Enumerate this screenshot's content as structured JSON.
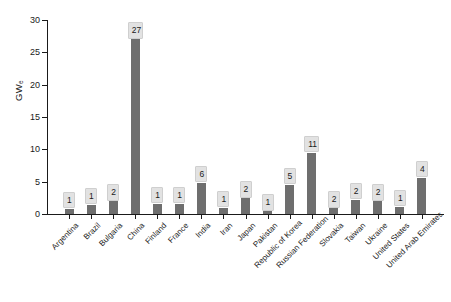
{
  "chart_data": {
    "type": "bar",
    "title": "",
    "xlabel": "",
    "ylabel": "GW",
    "ylabel_sub": "e",
    "ylim": [
      0,
      30
    ],
    "yticks": [
      0,
      5,
      10,
      15,
      20,
      25,
      30
    ],
    "ytick_labels": [
      "0",
      "5",
      "10",
      "15",
      "20",
      "25",
      "30"
    ],
    "grid": false,
    "legend": false,
    "bar_color": "#6e6e6e",
    "label_box_color": "#e2e2e2",
    "axis_color": "#1a1a1a",
    "categories": [
      "Argentina",
      "Brazil",
      "Bulgaria",
      "China",
      "Finland",
      "France",
      "India",
      "Iran",
      "Japan",
      "Pakistan",
      "Republic of Korea",
      "Russian Federation",
      "Slovakia",
      "Taiwan",
      "Ukraine",
      "United States",
      "United Arab Emirates"
    ],
    "values": [
      0.8,
      1.4,
      2.0,
      27.0,
      1.6,
      1.6,
      4.8,
      1.0,
      2.4,
      0.4,
      4.5,
      9.5,
      0.9,
      2.2,
      2.0,
      1.1,
      5.6
    ],
    "data_labels": [
      "1",
      "1",
      "2",
      "27",
      "1",
      "1",
      "6",
      "1",
      "2",
      "1",
      "5",
      "11",
      "2",
      "2",
      "2",
      "1",
      "4"
    ]
  }
}
